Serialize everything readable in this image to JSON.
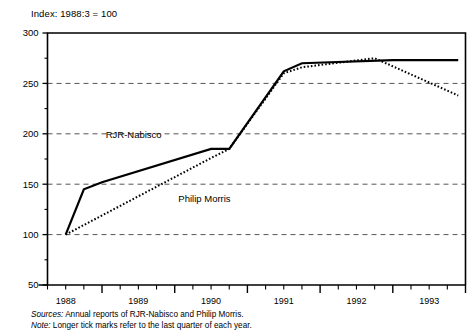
{
  "figure": {
    "index_note": "Index: 1988:3 = 100",
    "sources_lead": "Sources:",
    "sources_text": "Annual reports of RJR-Nabisco and Philip Morris.",
    "note_lead": "Note:",
    "note_text": "Longer tick marks refer to the last quarter of each year.",
    "line_color": "#000000",
    "grid_color": "#555555",
    "axis_color": "#000000"
  },
  "chart_data": {
    "type": "line",
    "title": "Index: 1988:3 = 100",
    "xlabel": "",
    "ylabel": "",
    "ylim": [
      50,
      300
    ],
    "yticks": [
      50,
      100,
      150,
      200,
      250,
      300
    ],
    "ytick_labels": [
      "50",
      "100",
      "150",
      "200",
      "250",
      "300"
    ],
    "yminor_step": 25,
    "grid": "horizontal-dashed",
    "legend": "inline-labels",
    "xlim": [
      1988.25,
      1994.0
    ],
    "xtick_years": [
      1988,
      1989,
      1990,
      1991,
      1992,
      1993
    ],
    "xtick_labels": [
      "1988",
      "1989",
      "1990",
      "1991",
      "1992",
      "1993"
    ],
    "x_quarter_ticks": true,
    "x_long_tick_note": "Longer tick marks refer to the last quarter of each year.",
    "series": [
      {
        "name": "RJR-Nabisco",
        "style": "solid",
        "label_x": 1989.05,
        "label_y": 196,
        "x": [
          1988.5,
          1988.75,
          1989.0,
          1990.5,
          1990.75,
          1991.5,
          1991.75,
          1993.0,
          1993.9
        ],
        "values": [
          100,
          145,
          152,
          185,
          185,
          262,
          270,
          273,
          273
        ]
      },
      {
        "name": "Philip Morris",
        "style": "dotted",
        "label_x": 1990.05,
        "label_y": 132,
        "x": [
          1988.5,
          1990.5,
          1990.75,
          1991.5,
          1991.75,
          1992.75,
          1993.9
        ],
        "values": [
          100,
          176,
          185,
          260,
          266,
          275,
          238
        ]
      }
    ]
  }
}
